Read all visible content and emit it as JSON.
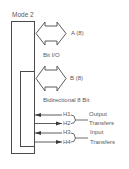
{
  "title": "Mode 2",
  "colors": {
    "line": "#4a4a4a",
    "text": "#5a5a5a",
    "background": "#ffffff"
  },
  "ports": [
    {
      "name": "A",
      "label": "A (8)",
      "description": "Bit I/O"
    },
    {
      "name": "B",
      "label": "B (8)",
      "description": "Bidirectional 8 Bit"
    }
  ],
  "handshake_lines": [
    {
      "label": "H1",
      "direction": "in"
    },
    {
      "label": "H2",
      "direction": "out"
    },
    {
      "label": "H3",
      "direction": "in"
    },
    {
      "label": "H4",
      "direction": "out"
    }
  ],
  "groups": [
    {
      "lines": [
        "H1",
        "H2"
      ],
      "line1": "Output",
      "line2": "Transfers"
    },
    {
      "lines": [
        "H3",
        "H4"
      ],
      "line1": "Input",
      "line2": "Transfers"
    }
  ]
}
